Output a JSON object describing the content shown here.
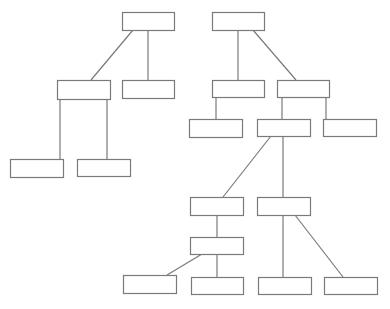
{
  "diagram": {
    "type": "tree",
    "line_color": "#7a7a7a",
    "box_fill": "#ffffff",
    "nodes": [
      {
        "id": "L0",
        "label": ""
      },
      {
        "id": "L1a",
        "label": ""
      },
      {
        "id": "L1b",
        "label": ""
      },
      {
        "id": "L2a",
        "label": ""
      },
      {
        "id": "L2b",
        "label": ""
      },
      {
        "id": "R0",
        "label": ""
      },
      {
        "id": "R1a",
        "label": ""
      },
      {
        "id": "R1b",
        "label": ""
      },
      {
        "id": "R2a",
        "label": ""
      },
      {
        "id": "R2b",
        "label": ""
      },
      {
        "id": "R2c",
        "label": ""
      },
      {
        "id": "R3a",
        "label": ""
      },
      {
        "id": "R3b",
        "label": ""
      },
      {
        "id": "R4a",
        "label": ""
      },
      {
        "id": "B1",
        "label": ""
      },
      {
        "id": "B2",
        "label": ""
      },
      {
        "id": "B3",
        "label": ""
      },
      {
        "id": "B4",
        "label": ""
      }
    ],
    "edges": [
      {
        "from": "L0",
        "to": "L1a"
      },
      {
        "from": "L0",
        "to": "L1b"
      },
      {
        "from": "L1a",
        "to": "L2a"
      },
      {
        "from": "L1a",
        "to": "L2b"
      },
      {
        "from": "R0",
        "to": "R1a"
      },
      {
        "from": "R0",
        "to": "R1b"
      },
      {
        "from": "R1a",
        "to": "R2a"
      },
      {
        "from": "R1b",
        "to": "R2b"
      },
      {
        "from": "R1b",
        "to": "R2c"
      },
      {
        "from": "R2b",
        "to": "R3a"
      },
      {
        "from": "R2b",
        "to": "R3b"
      },
      {
        "from": "R3a",
        "to": "R4a"
      },
      {
        "from": "R4a",
        "to": "B1"
      },
      {
        "from": "R4a",
        "to": "B2"
      },
      {
        "from": "R3b",
        "to": "B3"
      },
      {
        "from": "R3b",
        "to": "B4"
      }
    ]
  }
}
